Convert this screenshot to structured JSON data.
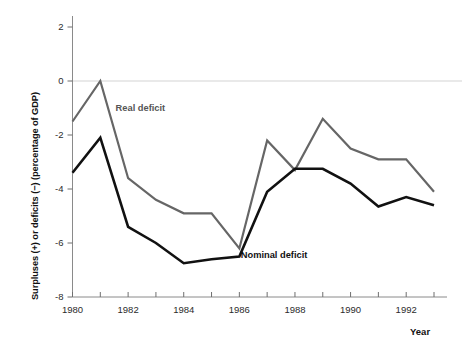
{
  "chart_data": {
    "type": "line",
    "title": "",
    "xlabel": "Year",
    "ylabel": "Surpluses (+) or deficits (−) (percentage of GDP)",
    "x": [
      1980,
      1981,
      1982,
      1983,
      1984,
      1985,
      1986,
      1987,
      1988,
      1989,
      1990,
      1991,
      1992,
      1993
    ],
    "xlim": [
      1980,
      1993
    ],
    "ylim": [
      -8,
      2
    ],
    "yticks": [
      2,
      0,
      -2,
      -4,
      -6,
      -8
    ],
    "ytick_labels": [
      "2",
      "0",
      "-2",
      "-4",
      "-6",
      "-8"
    ],
    "xticks": [
      1980,
      1981,
      1982,
      1983,
      1984,
      1985,
      1986,
      1987,
      1988,
      1989,
      1990,
      1991,
      1992,
      1993
    ],
    "xtick_labels_shown": [
      "1980",
      "1982",
      "1984",
      "1986",
      "1988",
      "1990",
      "1992"
    ],
    "xtick_labels_years": [
      1980,
      1982,
      1984,
      1986,
      1988,
      1990,
      1992
    ],
    "grid": "zero-line-only",
    "legend_position": "inline-annotations",
    "series": [
      {
        "name": "Real deficit",
        "color": "#666666",
        "values": [
          -1.5,
          0.0,
          -3.6,
          -4.4,
          -4.9,
          -4.9,
          -6.2,
          -2.2,
          -3.3,
          -1.4,
          -2.5,
          -2.9,
          -2.9,
          -4.1
        ],
        "label_x": 1981.55,
        "label_y": -1.1
      },
      {
        "name": "Nominal deficit",
        "color": "#111111",
        "values": [
          -3.4,
          -2.1,
          -5.4,
          -6.0,
          -6.75,
          -6.6,
          -6.5,
          -4.1,
          -3.25,
          -3.25,
          -3.8,
          -4.65,
          -4.3,
          -4.6
        ],
        "label_x": 1986.05,
        "label_y": -6.55
      }
    ]
  },
  "axes": {
    "y_title": "Surpluses (+) or deficits (−) (percentage of GDP)",
    "x_title": "Year"
  }
}
